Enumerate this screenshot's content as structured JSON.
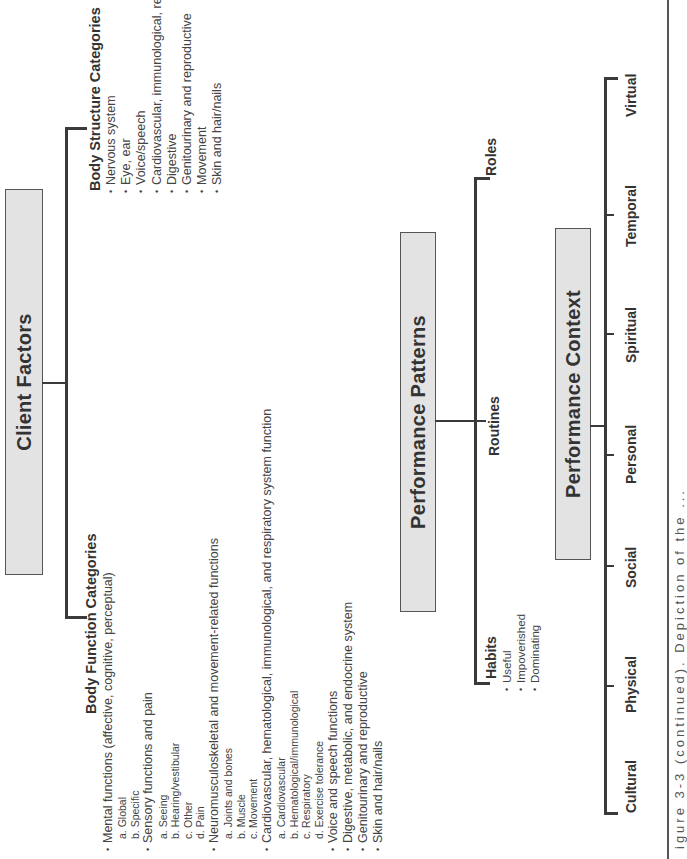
{
  "client_factors": {
    "title": "Client Factors",
    "body_function": {
      "heading": "Body Function Categories",
      "items": [
        {
          "label": "Mental functions (affective, cognitive, perceptual)",
          "subs": [
            "a. Global",
            "b. Specific"
          ]
        },
        {
          "label": "Sensory functions and pain",
          "subs": [
            "a. Seeing",
            "b. Hearing/vestibular",
            "c. Other",
            "d. Pain"
          ]
        },
        {
          "label": "Neuromusculoskeletal and movement-related functions",
          "subs": [
            "a. Joints and bones",
            "b. Muscle",
            "c. Movement"
          ]
        },
        {
          "label": "Cardiovascular, hematological, immunological, and respiratory system function",
          "subs": [
            "a. Cardiovascular",
            "b. Hematological/immunological",
            "c. Respiratory",
            "d. Exercise tolerance"
          ]
        },
        {
          "label": "Voice and speech functions",
          "subs": []
        },
        {
          "label": "Digestive, metabolic, and endocrine system",
          "subs": []
        },
        {
          "label": "Genitourinary and reproductive",
          "subs": []
        },
        {
          "label": "Skin and hair/nails",
          "subs": []
        }
      ]
    },
    "body_structure": {
      "heading": "Body Structure Categories",
      "items": [
        "Nervous system",
        "Eye, ear",
        "Voice/speech",
        "Cardiovascular, immunological, respiratory",
        "Digestive",
        "Genitourinary and reproductive",
        "Movement",
        "Skin and hair/nails"
      ]
    }
  },
  "performance_patterns": {
    "title": "Performance Patterns",
    "branches": [
      {
        "label": "Habits",
        "items": [
          "Useful",
          "Impoverished",
          "Dominating"
        ]
      },
      {
        "label": "Routines",
        "items": []
      },
      {
        "label": "Roles",
        "items": []
      }
    ]
  },
  "performance_context": {
    "title": "Performance Context",
    "branches": [
      "Cultural",
      "Physical",
      "Social",
      "Personal",
      "Spiritual",
      "Temporal",
      "Virtual"
    ]
  },
  "caption": {
    "text": "igure 3-3 (continued). Depiction of the ..."
  },
  "colors": {
    "box_fill": "#e3e3e3",
    "box_border": "#555555",
    "line": "#3a3a3a",
    "text": "#333333"
  }
}
